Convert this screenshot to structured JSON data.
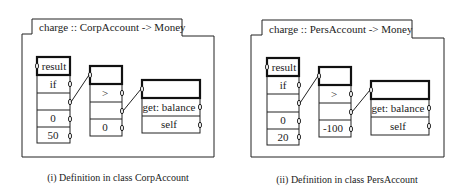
{
  "diagrams": [
    {
      "title": "charge :: CorpAccount -> Money",
      "caption": "(i) Definition in class CorpAccount",
      "col1": [
        "result",
        "if",
        "",
        "0",
        "50"
      ],
      "col2": [
        "",
        ">",
        "",
        "0"
      ],
      "col3": [
        "",
        "get: balance",
        "self"
      ]
    },
    {
      "title": "charge :: PersAccount -> Money",
      "caption": "(ii) Definition in class PersAccount",
      "col1": [
        "result",
        "if",
        "",
        "0",
        "20"
      ],
      "col2": [
        "",
        ">",
        "",
        "-100"
      ],
      "col3": [
        "",
        "get: balance",
        "self"
      ]
    }
  ]
}
